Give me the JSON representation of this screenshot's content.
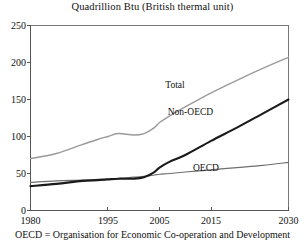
{
  "chart_data": {
    "type": "line",
    "title": "Quadrillion Btu (British thermal unit)",
    "xlabel": "",
    "ylabel": "",
    "xlim": [
      1980,
      2030
    ],
    "ylim": [
      0,
      250
    ],
    "grid": false,
    "legend": "inline-labels",
    "xticks": [
      1980,
      1995,
      2005,
      2015,
      2030
    ],
    "xtick_labels": [
      "1980",
      "1995",
      "2005",
      "2015",
      "2030"
    ],
    "yticks": [
      0,
      50,
      100,
      150,
      200,
      250
    ],
    "ytick_labels": [
      "0",
      "50",
      "100",
      "150",
      "200",
      "250"
    ],
    "x": [
      1980,
      1985,
      1990,
      1993,
      1995,
      1997,
      2000,
      2002,
      2004,
      2005,
      2007,
      2010,
      2015,
      2020,
      2025,
      2030
    ],
    "series": [
      {
        "name": "Total",
        "color": "#9a9a9a",
        "width": 1.4,
        "values": [
          70,
          77,
          89,
          96,
          100,
          104,
          102,
          104,
          112,
          119,
          128,
          140,
          159,
          176,
          192,
          207
        ]
      },
      {
        "name": "Non-OECD",
        "color": "#1a1a1a",
        "width": 2.1,
        "values": [
          33,
          36,
          40,
          41,
          42,
          43,
          43,
          45,
          52,
          58,
          66,
          75,
          94,
          112,
          131,
          150
        ]
      },
      {
        "name": "OECD",
        "color": "#6e6e6e",
        "width": 1.2,
        "values": [
          38,
          40,
          41,
          42,
          42,
          43,
          45,
          46,
          48,
          49,
          50,
          52,
          55,
          58,
          61,
          65
        ]
      }
    ],
    "annotations": [
      {
        "text": "Total",
        "x": 2008,
        "y": 170
      },
      {
        "text": "Non-OECD",
        "x": 2011,
        "y": 133
      },
      {
        "text": "OECD",
        "x": 2014,
        "y": 58
      }
    ]
  },
  "footnote": {
    "text": "OECD = Organisation for Economic Co-operation and Development"
  }
}
